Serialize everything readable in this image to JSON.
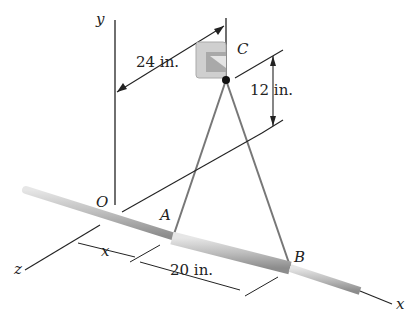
{
  "figure": {
    "labels": {
      "y_axis": "y",
      "x_axis": "x",
      "z_axis": "z",
      "origin": "O",
      "point_a": "A",
      "point_b": "B",
      "point_c": "C"
    },
    "dimensions": {
      "horizontal_offset": "24 in.",
      "vertical_offset": "12 in.",
      "collar_length": "20 in.",
      "variable_distance": "x"
    },
    "colors": {
      "rod": "#b8b8b8",
      "line": "#222222",
      "bracket": "#c8c8c8"
    }
  }
}
